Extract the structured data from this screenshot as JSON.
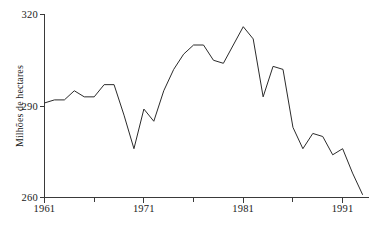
{
  "chart_data": {
    "type": "line",
    "title": "",
    "xlabel": "",
    "ylabel": "Milhões de hectares",
    "xlim": [
      1961,
      1993
    ],
    "ylim": [
      260,
      320
    ],
    "grid": false,
    "legend": false,
    "x_ticks": [
      1961,
      1971,
      1981,
      1991
    ],
    "x_minor_ticks": [
      1966,
      1976,
      1986
    ],
    "y_ticks": [
      260,
      290,
      320
    ],
    "x": [
      1961,
      1962,
      1963,
      1964,
      1965,
      1966,
      1967,
      1968,
      1969,
      1970,
      1971,
      1972,
      1973,
      1974,
      1975,
      1976,
      1977,
      1978,
      1979,
      1980,
      1981,
      1982,
      1983,
      1984,
      1985,
      1986,
      1987,
      1988,
      1989,
      1990,
      1991,
      1992,
      1993
    ],
    "values": [
      291,
      292,
      292,
      295,
      293,
      293,
      297,
      297,
      287,
      276,
      289,
      285,
      295,
      302,
      307,
      310,
      310,
      305,
      304,
      310,
      316,
      312,
      293,
      303,
      302,
      283,
      276,
      281,
      280,
      274,
      276,
      268,
      261
    ],
    "series": [
      {
        "name": "Milhões de hectares",
        "values": [
          291,
          292,
          292,
          295,
          293,
          293,
          297,
          297,
          287,
          276,
          289,
          285,
          295,
          302,
          307,
          310,
          310,
          305,
          304,
          310,
          316,
          312,
          293,
          303,
          302,
          283,
          276,
          281,
          280,
          274,
          276,
          268,
          261
        ]
      }
    ]
  },
  "axes": {
    "y_top_label": "320",
    "y_mid_label": "290",
    "y_bottom_label": "260",
    "x_labels": [
      "1961",
      "1971",
      "1981",
      "1991"
    ],
    "y_axis_title": "Milhões de hectares"
  },
  "colors": {
    "line": "#2b2b2b",
    "axis": "#3a3a3a",
    "background": "#ffffff"
  }
}
